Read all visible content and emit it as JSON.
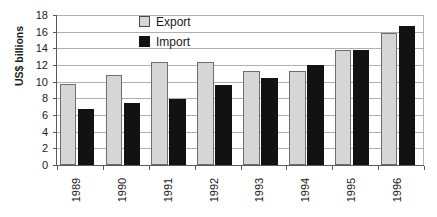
{
  "chart_data": {
    "type": "bar",
    "title": "",
    "subtitle": "",
    "xlabel": "",
    "ylabel": "US$ billions",
    "ylim": [
      0,
      18
    ],
    "ytick_step": 2,
    "yticks": [
      "18",
      "16",
      "14",
      "12",
      "10",
      "8",
      "6",
      "4",
      "2",
      "0"
    ],
    "ytick_values": [
      18,
      16,
      14,
      12,
      10,
      8,
      6,
      4,
      2,
      0
    ],
    "grid": true,
    "grid_axis": "y",
    "legend_position": "top-center",
    "categories": [
      "1989",
      "1990",
      "1991",
      "1992",
      "1993",
      "1994",
      "1995",
      "1996"
    ],
    "series": [
      {
        "name": "Export",
        "color": "#d6d6d6",
        "values": [
          9.7,
          10.8,
          12.4,
          12.4,
          11.3,
          11.3,
          13.8,
          15.8
        ]
      },
      {
        "name": "Import",
        "color": "#121212",
        "values": [
          6.7,
          7.4,
          7.9,
          9.6,
          10.4,
          12.0,
          13.8,
          16.7
        ]
      }
    ]
  },
  "legend": {
    "items": [
      {
        "label": "Export",
        "swatch": "export"
      },
      {
        "label": "Import",
        "swatch": "import"
      }
    ]
  },
  "colors": {
    "export_fill": "#d6d6d6",
    "import_fill": "#121212",
    "axis": "#5a5a5a",
    "gridline": "#b0b0b0",
    "text": "#1a1a1a",
    "background": "#ffffff"
  }
}
